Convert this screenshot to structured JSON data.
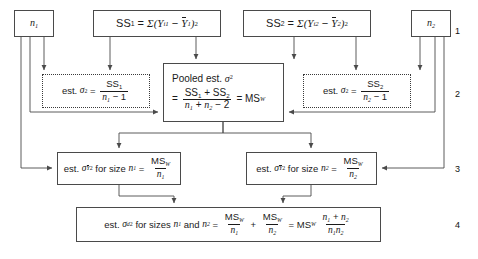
{
  "figure": {
    "type": "flowchart",
    "row_labels": [
      "1",
      "2",
      "3",
      "4"
    ]
  },
  "boxes": {
    "n1": {
      "label": "n",
      "sub": "1",
      "style": "solid"
    },
    "n2": {
      "label": "n",
      "sub": "2",
      "style": "solid"
    },
    "ss1": {
      "lhs": "SS",
      "lhs_sub": "1",
      "rhs_sigma": "Σ",
      "term": "(Y",
      "term_sub": "i1",
      "minus": "−",
      "mean": "Y",
      "mean_sub": "1",
      "close": ")",
      "power": "2",
      "style": "solid"
    },
    "ss2": {
      "lhs": "SS",
      "lhs_sub": "2",
      "rhs_sigma": "Σ",
      "term": "(Y",
      "term_sub": "i2",
      "minus": "−",
      "mean": "Y",
      "mean_sub": "2",
      "close": ")",
      "power": "2",
      "style": "solid"
    },
    "est1": {
      "prefix": "est.",
      "sigma": "σ",
      "power": "2",
      "equals": "=",
      "num": "SS",
      "num_sub": "1",
      "den_n": "n",
      "den_sub": "1",
      "den_rest": "− 1",
      "style": "dotted"
    },
    "est2": {
      "prefix": "est.",
      "sigma": "σ",
      "power": "2",
      "equals": "=",
      "num": "SS",
      "num_sub": "2",
      "den_n": "n",
      "den_sub": "2",
      "den_rest": "− 1",
      "style": "dotted"
    },
    "pooled": {
      "title_prefix": "Pooled est.",
      "title_sigma": "σ",
      "title_power": "2",
      "equals1": "=",
      "num1": "SS",
      "num1_sub": "1",
      "plus": "+",
      "num2": "SS",
      "num2_sub": "2",
      "den1": "n",
      "den1_sub": "1",
      "den_plus": "+",
      "den2": "n",
      "den2_sub": "2",
      "den_rest": "− 2",
      "equals2": "=",
      "result": "MS",
      "result_sub": "W",
      "style": "solid"
    },
    "ybar1": {
      "prefix": "est.",
      "sigma": "σ",
      "sigma_sub": "Y",
      "power": "2",
      "mid": "for size",
      "n": "n",
      "n_sub": "1",
      "equals": "=",
      "num": "MS",
      "num_sub": "W",
      "den": "n",
      "den_sub": "1",
      "style": "solid"
    },
    "ybar2": {
      "prefix": "est.",
      "sigma": "σ",
      "sigma_sub": "Y",
      "power": "2",
      "mid": "for size",
      "n": "n",
      "n_sub": "2",
      "equals": "=",
      "num": "MS",
      "num_sub": "W",
      "den": "n",
      "den_sub": "2",
      "style": "solid"
    },
    "sd": {
      "prefix": "est.",
      "sigma": "σ",
      "sigma_sub": "d",
      "power": "2",
      "mid": "for sizes",
      "n1": "n",
      "n1_sub": "1",
      "and": "and",
      "n2": "n",
      "n2_sub": "2",
      "equals": "=",
      "f1_num": "MS",
      "f1_num_sub": "W",
      "f1_den": "n",
      "f1_den_sub": "1",
      "plus": "+",
      "f2_num": "MS",
      "f2_num_sub": "W",
      "f2_den": "n",
      "f2_den_sub": "2",
      "equals2": "=",
      "msw": "MS",
      "msw_sub": "W",
      "f3_num_n1": "n",
      "f3_num_n1_sub": "1",
      "f3_num_plus": "+",
      "f3_num_n2": "n",
      "f3_num_n2_sub": "2",
      "f3_den_n1": "n",
      "f3_den_n1_sub": "1",
      "f3_den_n2": "n",
      "f3_den_n2_sub": "2",
      "style": "solid"
    }
  },
  "colors": {
    "line": "#4a4a4a",
    "dotted_line": "#3a3a3a",
    "background": "#ffffff",
    "text": "#1a1a1a"
  }
}
